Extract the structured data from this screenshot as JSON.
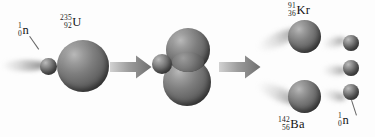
{
  "diagram": {
    "background_color": "#fdfdfd",
    "sphere_color": "#6a6a6a",
    "arrow_color": "#7d7d7d",
    "label_color": "#171717"
  },
  "stages": {
    "incoming": {
      "name": "incident-neutron",
      "label": {
        "mass_number": "1",
        "atomic_number": "0",
        "symbol": "n"
      }
    },
    "target": {
      "name": "uranium-235-nucleus",
      "label": {
        "mass_number": "235",
        "atomic_number": "92",
        "symbol": "U"
      }
    },
    "intermediate": {
      "name": "deformed-compound-nucleus",
      "label": ""
    },
    "products": {
      "fragment_top": {
        "name": "krypton-91-nucleus",
        "label": {
          "mass_number": "91",
          "atomic_number": "36",
          "symbol": "Kr"
        }
      },
      "fragment_bottom": {
        "name": "barium-142-nucleus",
        "label": {
          "mass_number": "142",
          "atomic_number": "56",
          "symbol": "Ba"
        }
      },
      "emitted_neutrons": {
        "name": "emitted-neutrons",
        "count": 3,
        "label": {
          "mass_number": "1",
          "atomic_number": "0",
          "symbol": "n"
        }
      }
    }
  },
  "arrows": [
    {
      "name": "arrow-capture-to-deform",
      "direction": "right"
    },
    {
      "name": "arrow-deform-to-split",
      "direction": "right"
    }
  ]
}
